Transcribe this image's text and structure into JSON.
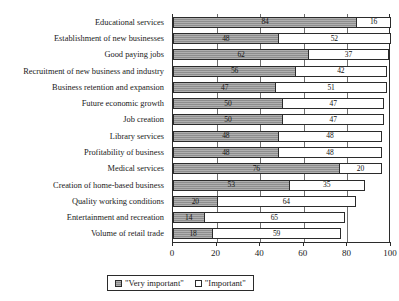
{
  "top_clipped_fragment": "",
  "chart_data": {
    "type": "bar",
    "orientation": "horizontal",
    "stacked": true,
    "title": "",
    "xlabel": "",
    "ylabel": "",
    "xlim": [
      0,
      100
    ],
    "xticks": [
      0,
      20,
      40,
      60,
      80,
      100
    ],
    "grid": true,
    "legend_position": "bottom",
    "legend": [
      "\"Very important\"",
      "\"Important\""
    ],
    "categories": [
      "Educational services",
      "Establishment of new businesses",
      "Good paying jobs",
      "Recruitment of new business and industry",
      "Business retention and expansion",
      "Future economic growth",
      "Job creation",
      "Library services",
      "Profitability of business",
      "Medical services",
      "Creation of home-based business",
      "Quality working conditions",
      "Entertainment and recreation",
      "Volume of retail trade"
    ],
    "series": [
      {
        "name": "\"Very important\"",
        "color": "#8e8e8e",
        "values": [
          84,
          48,
          62,
          56,
          47,
          50,
          50,
          48,
          48,
          76,
          53,
          20,
          14,
          18
        ]
      },
      {
        "name": "\"Important\"",
        "color": "#ffffff",
        "values": [
          16,
          52,
          37,
          42,
          51,
          47,
          47,
          48,
          48,
          20,
          35,
          64,
          65,
          59
        ]
      }
    ]
  }
}
